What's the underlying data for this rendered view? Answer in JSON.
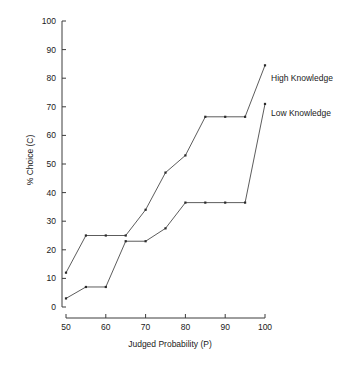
{
  "chart_data": {
    "type": "line",
    "title": "",
    "xlabel": "Judged Probability (P)",
    "ylabel": "% Choice (C)",
    "xlim": [
      50,
      100
    ],
    "ylim": [
      0,
      100
    ],
    "xticks": [
      50,
      60,
      70,
      80,
      90,
      100
    ],
    "yticks": [
      0,
      10,
      20,
      30,
      40,
      50,
      60,
      70,
      80,
      90,
      100
    ],
    "xtick_labels": [
      "50",
      "60",
      "70",
      "80",
      "90",
      "100"
    ],
    "ytick_labels": [
      "0",
      "10",
      "20",
      "30",
      "40",
      "50",
      "60",
      "70",
      "80",
      "90",
      "100"
    ],
    "grid": false,
    "legend_position": "inline-right-of-line-ends",
    "series": [
      {
        "name": "High Knowledge",
        "label": "High Knowledge",
        "color": "#4a4a4a",
        "x": [
          50,
          55,
          60,
          65,
          70,
          75,
          80,
          85,
          90,
          95,
          100
        ],
        "values": [
          12,
          25,
          25,
          25,
          34,
          47,
          53,
          66.5,
          66.5,
          66.5,
          84.5
        ]
      },
      {
        "name": "Low Knowledge",
        "label": "Low Knowledge",
        "color": "#4a4a4a",
        "x": [
          50,
          55,
          60,
          65,
          70,
          75,
          80,
          85,
          90,
          95,
          100
        ],
        "values": [
          3,
          7,
          7,
          23,
          23,
          27.5,
          36.5,
          36.5,
          36.5,
          36.5,
          71
        ]
      }
    ],
    "annotations": [
      {
        "text": "High Knowledge",
        "x": 100,
        "y": 80
      },
      {
        "text": "Low Knowledge",
        "x": 100,
        "y": 68
      }
    ]
  },
  "axes": {
    "x_axis_name": "judged-probability-axis",
    "y_axis_name": "percent-choice-axis"
  }
}
